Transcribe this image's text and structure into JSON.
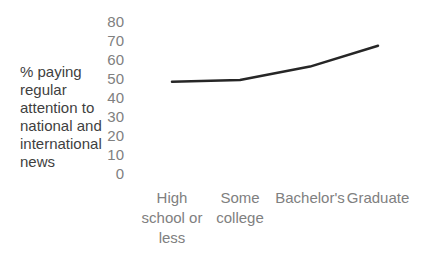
{
  "chart_data": {
    "type": "line",
    "categories": [
      "High school or less",
      "Some college",
      "Bachelor's",
      "Graduate"
    ],
    "values": [
      48,
      49,
      56,
      67
    ],
    "title": "",
    "xlabel": "",
    "ylabel": "% paying regular attention to national and international news",
    "ylabel_lines": [
      "% paying",
      "regular",
      "attention to",
      "national and",
      "international",
      "news"
    ],
    "yticks": [
      80,
      70,
      60,
      50,
      40,
      30,
      20,
      10,
      0
    ],
    "ylim": [
      0,
      80
    ],
    "grid": false,
    "legend": "none",
    "axis_lines": "none",
    "colors": {
      "line": "#262626",
      "tick_text": "#808080",
      "axis_title_text": "#3f3f3f",
      "background": "#ffffff"
    }
  }
}
